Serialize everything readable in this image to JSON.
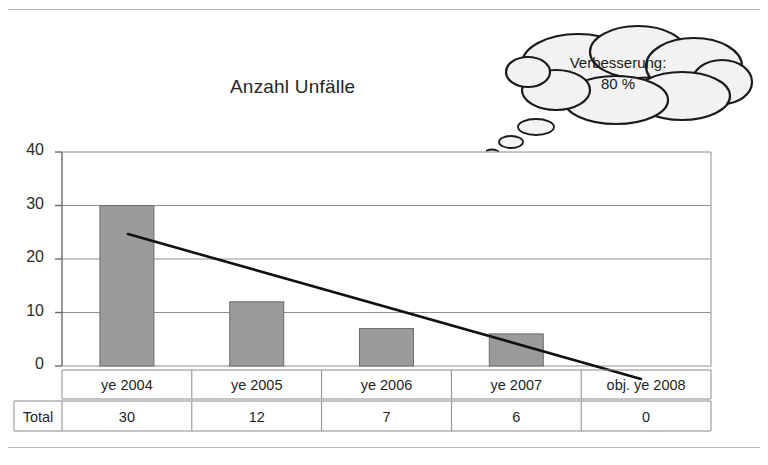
{
  "chart_data": {
    "type": "bar",
    "title": "Anzahl Unfälle",
    "xlabel": "",
    "ylabel": "",
    "categories": [
      "ye 2004",
      "ye 2005",
      "ye 2006",
      "ye 2007",
      "obj. ye 2008"
    ],
    "values": [
      30,
      12,
      7,
      6,
      0
    ],
    "series": [
      {
        "name": "Anzahl Unfälle",
        "values": [
          30,
          12,
          7,
          6,
          0
        ]
      }
    ],
    "ylim": [
      0,
      40
    ],
    "yticks": [
      "0",
      "10",
      "20",
      "30",
      "40"
    ],
    "grid": "horizontal",
    "legend": "none",
    "bar_color": "#9b9b9b",
    "bar_edge_color": "#6d6d6d",
    "trendline": {
      "type": "line",
      "color": "#111111",
      "start_value": 24.5,
      "end_value": -2.2,
      "note": "declining trend line drawn across the plot"
    },
    "data_table": {
      "row_label": "Total",
      "columns": [
        "ye 2004",
        "ye 2005",
        "ye 2006",
        "ye 2007",
        "obj. ye 2008"
      ],
      "values": [
        "30",
        "12",
        "7",
        "6",
        "0"
      ]
    },
    "annotation": {
      "shape": "thought-bubble",
      "line1": "Verbesserung:",
      "line2": "80 %"
    }
  }
}
